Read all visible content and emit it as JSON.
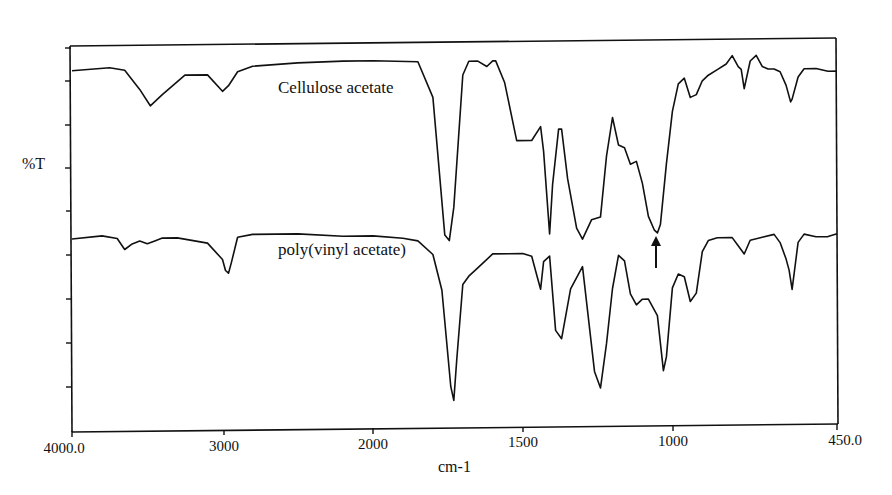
{
  "chart_data": {
    "type": "line",
    "title": "",
    "xlabel": "cm-1",
    "ylabel": "%T",
    "xlim": [
      4000.0,
      450.0
    ],
    "x_ticks": [
      "4000.0",
      "3000",
      "2000",
      "1500",
      "1000",
      "450.0"
    ],
    "x_scale_note": "scale expands below 2000 cm-1 (2x)",
    "grid": false,
    "legend": "inline labels",
    "annotations": [
      {
        "type": "arrow",
        "x": 1050,
        "direction": "up",
        "target": "Cellulose acetate band near 1050 cm-1"
      }
    ],
    "series": [
      {
        "name": "Cellulose acetate",
        "x": [
          4000,
          3750,
          3650,
          3550,
          3480,
          3400,
          3250,
          3100,
          3000,
          2960,
          2900,
          2800,
          2500,
          2200,
          2000,
          1850,
          1800,
          1760,
          1745,
          1730,
          1700,
          1680,
          1650,
          1620,
          1600,
          1590,
          1560,
          1520,
          1470,
          1440,
          1430,
          1410,
          1400,
          1380,
          1370,
          1350,
          1320,
          1300,
          1270,
          1240,
          1220,
          1200,
          1180,
          1160,
          1140,
          1120,
          1100,
          1080,
          1060,
          1050,
          1040,
          1020,
          1000,
          980,
          960,
          940,
          920,
          900,
          880,
          850,
          820,
          800,
          780,
          770,
          760,
          740,
          720,
          700,
          680,
          660,
          640,
          620,
          605,
          600,
          580,
          560,
          520,
          480,
          450
        ],
        "y": [
          91,
          92,
          91,
          84,
          78,
          82,
          89,
          89,
          83,
          85,
          90,
          92,
          93,
          93.5,
          93.5,
          93,
          80,
          30,
          28,
          40,
          88,
          93,
          93,
          91,
          93,
          93,
          85,
          64,
          64,
          69,
          60,
          30,
          48,
          68,
          68,
          50,
          32,
          28,
          35,
          36,
          58,
          72,
          62,
          61,
          55,
          56,
          48,
          36,
          31,
          30,
          33,
          55,
          74,
          84,
          86,
          79,
          80,
          85,
          87,
          89,
          91,
          94,
          90,
          89,
          82,
          92,
          94,
          90,
          89,
          89,
          88,
          83,
          77,
          78,
          86,
          89,
          89,
          88,
          88
        ]
      },
      {
        "name": "poly(vinyl acetate)",
        "x": [
          4000,
          3800,
          3700,
          3650,
          3600,
          3550,
          3500,
          3450,
          3400,
          3300,
          3100,
          3000,
          2980,
          2960,
          2940,
          2900,
          2800,
          2500,
          2200,
          2000,
          1900,
          1850,
          1800,
          1770,
          1740,
          1730,
          1720,
          1700,
          1680,
          1650,
          1600,
          1500,
          1470,
          1450,
          1440,
          1430,
          1410,
          1390,
          1370,
          1340,
          1300,
          1260,
          1240,
          1220,
          1200,
          1180,
          1160,
          1140,
          1120,
          1100,
          1080,
          1050,
          1030,
          1020,
          1000,
          980,
          960,
          940,
          920,
          900,
          880,
          850,
          800,
          780,
          760,
          740,
          700,
          660,
          640,
          620,
          610,
          600,
          580,
          560,
          520,
          480,
          450
        ],
        "y": [
          30,
          31,
          30,
          26,
          28,
          29,
          28,
          29,
          30,
          30,
          28,
          22,
          18,
          17,
          21,
          30,
          31,
          31,
          30,
          30,
          29,
          28,
          23,
          10,
          -25,
          -30,
          -15,
          12,
          15,
          18,
          23,
          23,
          22,
          14,
          10,
          20,
          22,
          -5,
          -8,
          10,
          18,
          -20,
          -26,
          -10,
          10,
          22,
          20,
          8,
          4,
          6,
          6,
          0,
          -20,
          -15,
          10,
          15,
          14,
          5,
          8,
          23,
          27,
          28,
          28,
          25,
          22,
          27,
          28,
          29,
          26,
          20,
          16,
          9,
          26,
          29,
          28,
          28,
          29
        ]
      }
    ]
  },
  "labels": {
    "ylabel": "%T",
    "xlabel": "cm-1",
    "series_top": "Cellulose acetate",
    "series_bottom": "poly(vinyl acetate)",
    "ticks": {
      "t4000": "4000.0",
      "t3000": "3000",
      "t2000": "2000",
      "t1500": "1500",
      "t1000": "1000",
      "t450": "450.0"
    }
  }
}
